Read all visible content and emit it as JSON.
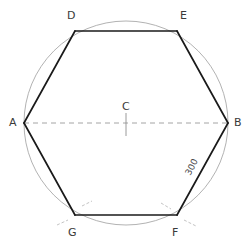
{
  "figure": {
    "type": "geometric-construction",
    "colors": {
      "hexagon_stroke": "#1a1a1a",
      "circle_stroke": "#a9a9a9",
      "diameter_stroke": "#9a9a9a",
      "construction_arc_stroke": "#b0b0b0",
      "label_text": "#3a3a3a",
      "background": "#ffffff"
    },
    "circle": {
      "center_x": 126,
      "center_y": 123,
      "radius": 102
    },
    "center_point": {
      "label": "C",
      "x": 126,
      "y": 123,
      "label_x": 122,
      "label_y": 101
    },
    "vertices": [
      {
        "label": "A",
        "x": 24,
        "y": 123,
        "label_x": 9,
        "label_y": 117
      },
      {
        "label": "D",
        "x": 75,
        "y": 31,
        "label_x": 67,
        "label_y": 10
      },
      {
        "label": "E",
        "x": 177,
        "y": 31,
        "label_x": 180,
        "label_y": 10
      },
      {
        "label": "B",
        "x": 228,
        "y": 123,
        "label_x": 234,
        "label_y": 117
      },
      {
        "label": "F",
        "x": 177,
        "y": 215,
        "label_x": 172,
        "label_y": 227
      },
      {
        "label": "G",
        "x": 75,
        "y": 215,
        "label_x": 68,
        "label_y": 227
      }
    ],
    "edges": [
      {
        "from": "A",
        "to": "D"
      },
      {
        "from": "D",
        "to": "E"
      },
      {
        "from": "E",
        "to": "B"
      },
      {
        "from": "B",
        "to": "F"
      },
      {
        "from": "F",
        "to": "G"
      },
      {
        "from": "G",
        "to": "A"
      }
    ],
    "diameter": {
      "name": "diameter-AB",
      "from": "A",
      "to": "B",
      "style": "dashed"
    },
    "center_tick": {
      "name": "center-tick-mark",
      "x": 126,
      "y_top": 113,
      "y_bottom": 135
    },
    "dimension_label": {
      "text": "300",
      "on_edge": "B-F",
      "rotation_deg": -63,
      "x": 183,
      "y": 162
    },
    "construction_arcs": [
      {
        "at": "G",
        "name": "arc-mark-g-upper"
      },
      {
        "at": "G",
        "name": "arc-mark-g-lower"
      },
      {
        "at": "F",
        "name": "arc-mark-f-upper"
      },
      {
        "at": "F",
        "name": "arc-mark-f-lower"
      }
    ]
  }
}
